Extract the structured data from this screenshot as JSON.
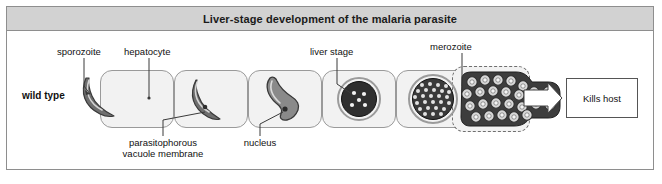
{
  "figure": {
    "title": "Liver-stage development of the malaria parasite",
    "row_label": "wild type",
    "outcome_label": "Kills host",
    "labels": {
      "sporozoite": "sporozoite",
      "hepatocyte": "hepatocyte",
      "liver_stage": "liver stage",
      "merozoite": "merozoite",
      "pvm_line1": "parasitophorous",
      "pvm_line2": "vacuole membrane",
      "nucleus": "nucleus"
    },
    "stages": [
      {
        "name": "sporozoite-entering-hepatocyte",
        "description": "crescent sporozoite at cell edge"
      },
      {
        "name": "sporozoite-inside-hepatocyte",
        "description": "crescent parasite within hepatocyte"
      },
      {
        "name": "trophozoite-branched",
        "description": "branched parasite with nucleus"
      },
      {
        "name": "early-liver-stage-schizont",
        "description": "dark ring with five nuclei"
      },
      {
        "name": "mature-schizont",
        "description": "circle densely packed with forming merozoites"
      },
      {
        "name": "ruptured-cell-merozoites",
        "description": "dashed ruptured cell releasing merozoites"
      }
    ],
    "colors": {
      "title_bar": "#d2d2d2",
      "frame_border": "#8e8e8e",
      "cell_fill": "#f2f2f2",
      "cell_border": "#9a9a9a",
      "parasite_dark": "#4a4a4a",
      "parasite_mid": "#7d7d7d",
      "schizont_dark": "#3d3d3d",
      "text": "#111111"
    }
  }
}
